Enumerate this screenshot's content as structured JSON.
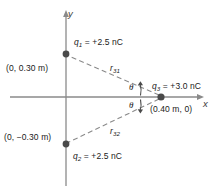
{
  "figure": {
    "background_color": "#ffffff",
    "axis_color": "#8a8a8a",
    "dash_color": "#8a8a8a",
    "charge_dot_color": "#4a4a4a",
    "text_color": "#1a1a1a"
  },
  "axes": {
    "x_label": "x",
    "y_label": "y",
    "origin_px": {
      "x": 66,
      "y": 97
    }
  },
  "charges": [
    {
      "id": "q1",
      "symbol": "q",
      "subscript": "1",
      "label": "q1 = +2.5 nC",
      "value_text": "= +2.5 nC",
      "charge_nC": 2.5,
      "position_label": "(0, 0.30 m)",
      "coords_m": [
        0,
        0.3
      ],
      "dot_px": {
        "x": 66,
        "y": 54
      }
    },
    {
      "id": "q2",
      "symbol": "q",
      "subscript": "2",
      "label": "q2 = +2.5 nC",
      "value_text": "= +2.5 nC",
      "charge_nC": 2.5,
      "position_label": "(0, −0.30 m)",
      "coords_m": [
        0,
        -0.3
      ],
      "dot_px": {
        "x": 66,
        "y": 144
      }
    },
    {
      "id": "q3",
      "symbol": "q",
      "subscript": "3",
      "label": "q3 = +3.0 nC",
      "value_text": "= +3.0 nC",
      "charge_nC": 3.0,
      "position_label": "(0.40 m, 0)",
      "coords_m": [
        0.4,
        0
      ],
      "dot_px": {
        "x": 161,
        "y": 97
      }
    }
  ],
  "distances": [
    {
      "id": "r31",
      "symbol": "r",
      "subscript": "31",
      "from": "q3",
      "to": "q1",
      "style": "dashed"
    },
    {
      "id": "r32",
      "symbol": "r",
      "subscript": "32",
      "from": "q3",
      "to": "q2",
      "style": "dashed"
    }
  ],
  "angles": [
    {
      "id": "theta-upper",
      "label": "θ",
      "between": "r31 and +x axis"
    },
    {
      "id": "theta-lower",
      "label": "θ",
      "between": "r32 and +x axis"
    }
  ]
}
